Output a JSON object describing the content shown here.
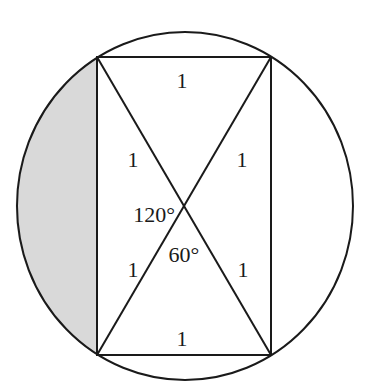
{
  "diagram": {
    "colors": {
      "stroke": "#1a1a1a",
      "shade": "#d9d9d9",
      "background": "#ffffff"
    },
    "circle": {
      "cx": 185,
      "cy": 206,
      "rx": 168,
      "ry": 174
    },
    "rectangle": {
      "top_left": [
        97,
        57
      ],
      "top_right": [
        271,
        57
      ],
      "bottom_right": [
        271,
        355
      ],
      "bottom_left": [
        97,
        355
      ]
    },
    "intersection": [
      184,
      206
    ],
    "labels": {
      "top_side": "1",
      "bottom_side": "1",
      "upper_left_half_diagonal": "1",
      "upper_right_half_diagonal": "1",
      "lower_left_half_diagonal": "1",
      "lower_right_half_diagonal": "1",
      "angle_obtuse": "120°",
      "angle_acute": "60°"
    }
  }
}
